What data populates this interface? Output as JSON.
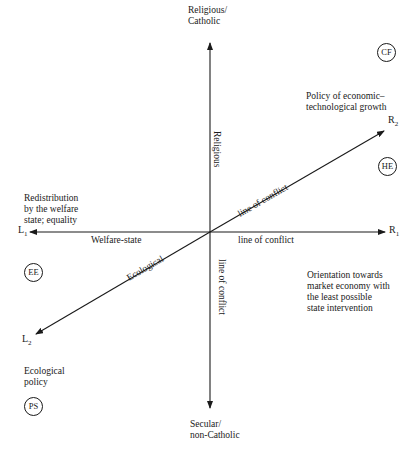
{
  "diagram": {
    "axes": {
      "vertical": {
        "top_label": "Religious/\nCatholic",
        "bottom_label": "Secular/\nnon-Catholic",
        "upper_caption": "Religious",
        "lower_caption": "line of conflict"
      },
      "horizontal": {
        "left_end": "L",
        "left_sub": "1",
        "right_end": "R",
        "right_sub": "1",
        "left_caption": "Welfare-state",
        "right_caption": "line of conflict"
      },
      "diagonal": {
        "upper_end": "R",
        "upper_sub": "2",
        "lower_end": "L",
        "lower_sub": "2",
        "upper_caption": "line of conflict",
        "lower_caption": "Ecological"
      }
    },
    "region_labels": {
      "top_right": "Policy of economic–\ntechnological growth",
      "left": "Redistribution\nby the welfare\nstate; equality",
      "right": "Orientation towards\nmarket economy with\nthe least possible\nstate intervention",
      "bottom_left": "Ecological\npolicy"
    },
    "parties": [
      {
        "id": "CF",
        "label": "CF"
      },
      {
        "id": "HE",
        "label": "HE"
      },
      {
        "id": "EE",
        "label": "EE"
      },
      {
        "id": "PS",
        "label": "PS"
      }
    ],
    "colors": {
      "ink": "#1a1a1a",
      "background": "#ffffff"
    }
  }
}
